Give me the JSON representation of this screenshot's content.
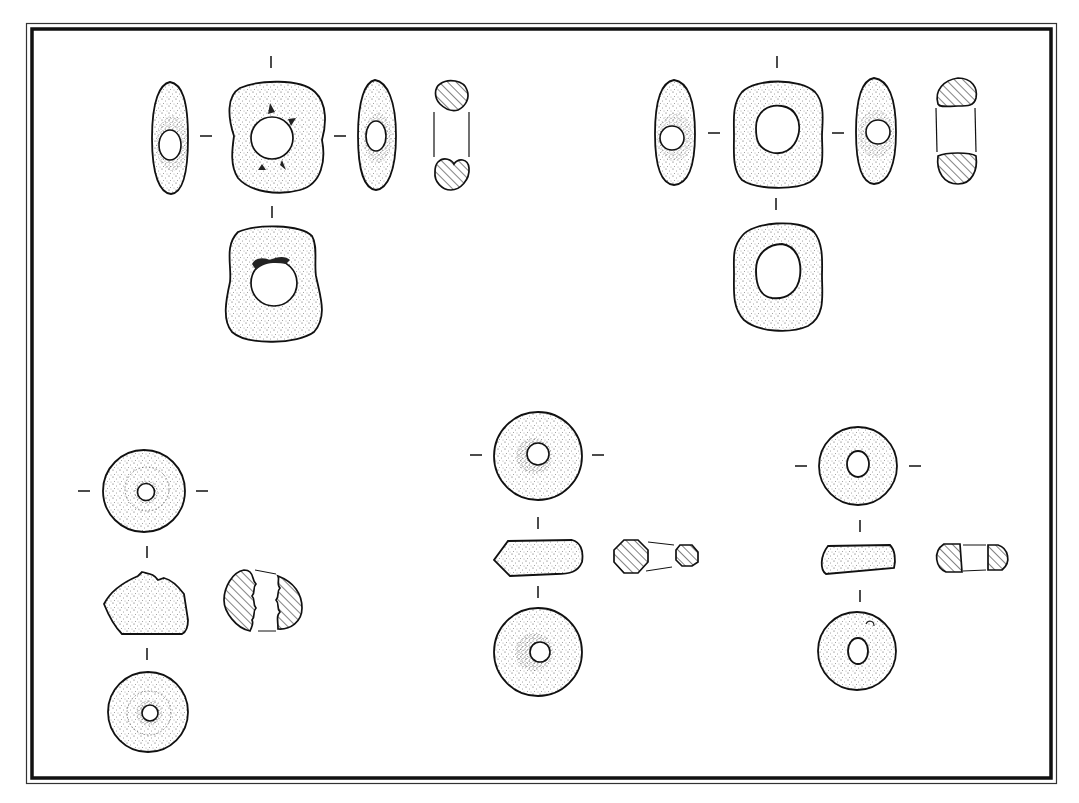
{
  "figure": {
    "type": "archaeological illustration plate",
    "background": "#ffffff",
    "ink": "#1a1a1a",
    "frame": {
      "style": "double rule (thin outer, thick inner)",
      "outer": {
        "x": 26,
        "y": 23,
        "w": 1030,
        "h": 760,
        "stroke": 1.2
      },
      "inner": {
        "x": 32,
        "y": 29,
        "w": 1019,
        "h": 749,
        "stroke": 3.5
      }
    }
  },
  "objects": [
    {
      "id": "bead-top-left",
      "label": "Large irregular ring bead with notched perforation",
      "views": [
        "left profile",
        "front (plan)",
        "right profile",
        "section",
        "rear (plan)"
      ],
      "front": {
        "cx": 272,
        "cy": 135,
        "rx": 52,
        "ry": 55,
        "hole_r": 22
      },
      "rear": {
        "cx": 272,
        "cy": 285,
        "rx": 50,
        "ry": 58,
        "hole_r": 23
      },
      "section": {
        "x": 450,
        "top_y": 95,
        "bottom_y": 175
      }
    },
    {
      "id": "bead-top-right",
      "label": "Large oval ring bead",
      "views": [
        "left profile",
        "front (plan)",
        "right profile",
        "section",
        "rear (plan)"
      ],
      "front": {
        "cx": 776,
        "cy": 132,
        "rx": 45,
        "ry": 53,
        "hole_r": 22
      },
      "rear": {
        "cx": 778,
        "cy": 275,
        "rx": 44,
        "ry": 55,
        "hole_r": 23
      },
      "section": {
        "x": 957,
        "top_y": 95,
        "bottom_y": 170
      }
    },
    {
      "id": "whorl-bottom-left",
      "label": "Conical bead / whorl with stepped bore",
      "views": [
        "top (plan)",
        "profile",
        "section",
        "bottom (plan)"
      ],
      "top": {
        "cx": 145,
        "cy": 491,
        "r": 42,
        "hole_r": 10
      },
      "profile": {
        "cx": 146,
        "cy": 605
      },
      "bottom": {
        "cx": 149,
        "cy": 712,
        "r": 40,
        "hole_r": 9
      },
      "section": {
        "x": 263,
        "y": 600
      }
    },
    {
      "id": "whorl-bottom-middle",
      "label": "Disc bead with tapered profile",
      "views": [
        "top (plan)",
        "profile",
        "section",
        "bottom (plan)"
      ],
      "top": {
        "cx": 537,
        "cy": 455,
        "r": 45,
        "hole_r": 12
      },
      "profile": {
        "cx": 538,
        "cy": 556
      },
      "bottom": {
        "cx": 538,
        "cy": 652,
        "r": 45,
        "hole_r": 11
      },
      "section": {
        "x": 655,
        "y": 555
      }
    },
    {
      "id": "whorl-bottom-right",
      "label": "Flat disc bead",
      "views": [
        "top (plan)",
        "profile",
        "section",
        "bottom (plan)"
      ],
      "top": {
        "cx": 858,
        "cy": 466,
        "r": 39,
        "hole_r": 12
      },
      "profile": {
        "cx": 859,
        "cy": 560
      },
      "bottom": {
        "cx": 857,
        "cy": 651,
        "r": 39,
        "hole_r": 11
      },
      "section": {
        "x": 972,
        "y": 558
      }
    }
  ],
  "conventions": {
    "view_alignment_ticks": "short dashes marking projection axes between views",
    "section_hatching": "diagonal hatch lines at 45°",
    "surface_rendering": "stipple shading"
  }
}
